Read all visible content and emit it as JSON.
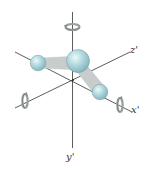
{
  "diagram": {
    "title": "",
    "axes": [
      {
        "id": "x",
        "label": "x'"
      },
      {
        "id": "y",
        "label": "y'"
      },
      {
        "id": "z",
        "label": "z'"
      }
    ],
    "atoms": [
      {
        "id": "central",
        "description": "large central atom"
      },
      {
        "id": "left",
        "description": "small atom on left"
      },
      {
        "id": "right",
        "description": "small atom on right"
      }
    ],
    "bonds": [
      {
        "from": "central",
        "to": "left"
      },
      {
        "from": "central",
        "to": "right"
      }
    ],
    "rotation_indicators": [
      {
        "axis": "y",
        "description": "rotation about vertical axis"
      },
      {
        "axis": "x",
        "description": "rotation about x' axis"
      },
      {
        "axis": "z",
        "description": "rotation about z' axis"
      }
    ],
    "colors": {
      "atom_fill": "#a9d2d8",
      "atom_highlight": "#e6f4f6",
      "atom_edge": "#6e9aa1",
      "bond": "#c8cccc",
      "axis": "#333333",
      "rotation_arrow": "#9a9e9e"
    }
  }
}
